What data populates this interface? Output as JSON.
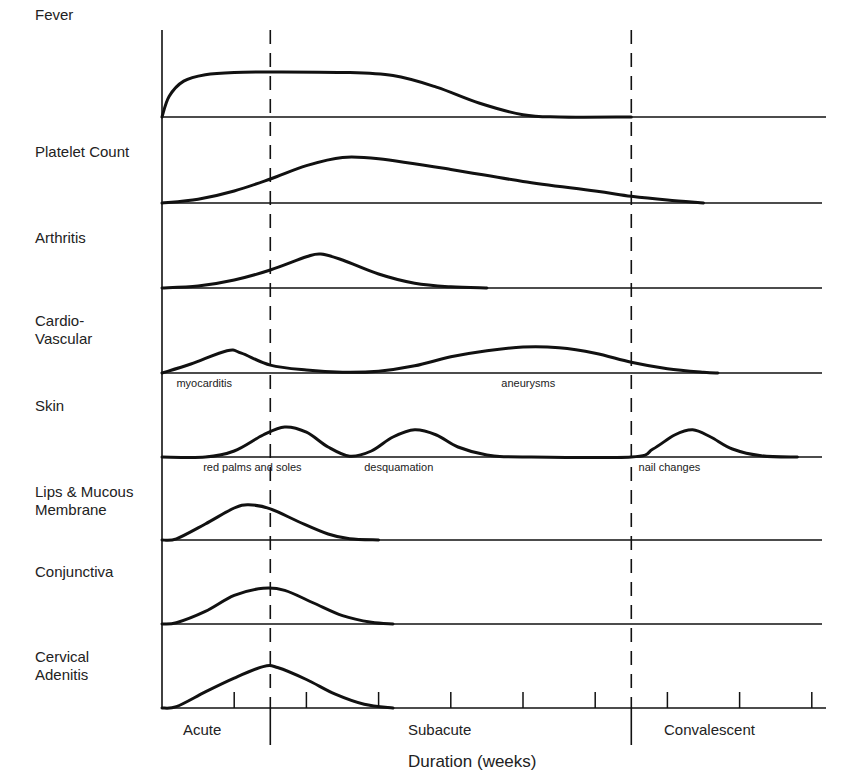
{
  "chart_data": {
    "type": "line",
    "title": "",
    "xlabel": "Duration (weeks)",
    "ylabel": "",
    "layout": "stacked small-multiples, one clinical feature per row, shared time axis",
    "x_unit": "weeks",
    "xlim": [
      0,
      9.2
    ],
    "x_ticks": [
      1,
      2,
      3,
      4,
      5,
      6,
      7,
      8,
      9
    ],
    "grid": false,
    "phases": [
      {
        "label": "Acute",
        "start": 0,
        "end": 1.5
      },
      {
        "label": "Subacute",
        "start": 1.5,
        "end": 6.5
      },
      {
        "label": "Convalescent",
        "start": 6.5,
        "end": 9.2
      }
    ],
    "phase_dividers": [
      1.5,
      6.5
    ],
    "rows": [
      {
        "label": "Fever",
        "annotations": [],
        "points": [
          [
            0,
            0
          ],
          [
            0.1,
            0.45
          ],
          [
            0.3,
            0.78
          ],
          [
            0.6,
            0.92
          ],
          [
            1,
            0.97
          ],
          [
            1.5,
            0.98
          ],
          [
            2.5,
            0.97
          ],
          [
            3.2,
            0.9
          ],
          [
            3.8,
            0.65
          ],
          [
            4.4,
            0.3
          ],
          [
            5,
            0.05
          ],
          [
            5.5,
            0
          ],
          [
            6.5,
            0
          ]
        ]
      },
      {
        "label": "Platelet Count",
        "annotations": [],
        "points": [
          [
            0,
            0
          ],
          [
            0.5,
            0.08
          ],
          [
            1,
            0.25
          ],
          [
            1.5,
            0.5
          ],
          [
            2,
            0.78
          ],
          [
            2.5,
            0.95
          ],
          [
            3,
            0.92
          ],
          [
            4,
            0.7
          ],
          [
            5,
            0.45
          ],
          [
            6,
            0.25
          ],
          [
            6.5,
            0.14
          ],
          [
            7,
            0.06
          ],
          [
            7.5,
            0
          ]
        ]
      },
      {
        "label": "Arthritis",
        "annotations": [],
        "points": [
          [
            0,
            0
          ],
          [
            0.5,
            0.05
          ],
          [
            1,
            0.2
          ],
          [
            1.5,
            0.45
          ],
          [
            2,
            0.78
          ],
          [
            2.2,
            0.85
          ],
          [
            2.5,
            0.7
          ],
          [
            3,
            0.35
          ],
          [
            3.5,
            0.12
          ],
          [
            4,
            0.03
          ],
          [
            4.5,
            0
          ]
        ]
      },
      {
        "label": "Cardio-\nVascular",
        "annotations": [
          {
            "text": "myocarditis",
            "x": 0.2
          },
          {
            "text": "aneurysms",
            "x": 4.7
          }
        ],
        "points": [
          [
            0,
            0
          ],
          [
            0.4,
            0.25
          ],
          [
            0.9,
            0.62
          ],
          [
            1.1,
            0.55
          ],
          [
            1.5,
            0.22
          ],
          [
            2,
            0.08
          ],
          [
            2.5,
            0.02
          ],
          [
            3,
            0.05
          ],
          [
            3.5,
            0.2
          ],
          [
            4,
            0.45
          ],
          [
            4.5,
            0.62
          ],
          [
            5,
            0.72
          ],
          [
            5.5,
            0.7
          ],
          [
            6,
            0.55
          ],
          [
            6.5,
            0.3
          ],
          [
            7,
            0.12
          ],
          [
            7.5,
            0.02
          ],
          [
            7.7,
            0
          ]
        ]
      },
      {
        "label": "Skin",
        "annotations": [
          {
            "text": "red palms and soles",
            "x": 0.57
          },
          {
            "text": "desquamation",
            "x": 2.8
          },
          {
            "text": "nail changes",
            "x": 6.6
          }
        ],
        "points": [
          [
            0,
            0
          ],
          [
            0.6,
            0
          ],
          [
            1,
            0.15
          ],
          [
            1.4,
            0.55
          ],
          [
            1.7,
            0.75
          ],
          [
            2,
            0.62
          ],
          [
            2.3,
            0.25
          ],
          [
            2.6,
            0.02
          ],
          [
            2.9,
            0.15
          ],
          [
            3.2,
            0.5
          ],
          [
            3.5,
            0.68
          ],
          [
            3.8,
            0.55
          ],
          [
            4.1,
            0.25
          ],
          [
            4.5,
            0.05
          ],
          [
            5,
            0
          ],
          [
            6.5,
            0
          ],
          [
            6.8,
            0.2
          ],
          [
            7.1,
            0.55
          ],
          [
            7.35,
            0.68
          ],
          [
            7.6,
            0.5
          ],
          [
            7.9,
            0.2
          ],
          [
            8.3,
            0.03
          ],
          [
            8.8,
            0
          ]
        ]
      },
      {
        "label": "Lips & Mucous\nMembrane",
        "annotations": [],
        "points": [
          [
            0,
            0
          ],
          [
            0.2,
            0.03
          ],
          [
            0.6,
            0.4
          ],
          [
            1,
            0.8
          ],
          [
            1.2,
            0.88
          ],
          [
            1.5,
            0.78
          ],
          [
            1.9,
            0.45
          ],
          [
            2.3,
            0.15
          ],
          [
            2.6,
            0.03
          ],
          [
            3,
            0
          ]
        ]
      },
      {
        "label": "Conjunctiva",
        "annotations": [],
        "points": [
          [
            0,
            0
          ],
          [
            0.2,
            0.03
          ],
          [
            0.6,
            0.3
          ],
          [
            1,
            0.68
          ],
          [
            1.4,
            0.85
          ],
          [
            1.7,
            0.8
          ],
          [
            2.1,
            0.5
          ],
          [
            2.5,
            0.2
          ],
          [
            2.9,
            0.04
          ],
          [
            3.2,
            0
          ]
        ]
      },
      {
        "label": "Cervical\nAdenitis",
        "annotations": [],
        "points": [
          [
            0,
            0
          ],
          [
            0.2,
            0.03
          ],
          [
            0.6,
            0.35
          ],
          [
            1,
            0.65
          ],
          [
            1.4,
            0.9
          ],
          [
            1.6,
            0.88
          ],
          [
            2,
            0.62
          ],
          [
            2.4,
            0.3
          ],
          [
            2.8,
            0.08
          ],
          [
            3.2,
            0
          ]
        ]
      }
    ]
  },
  "axis": {
    "xlabel": "Duration (weeks)",
    "phase_labels": [
      "Acute",
      "Subacute",
      "Convalescent"
    ]
  },
  "style": {
    "ink": "#111111",
    "background": "#ffffff"
  }
}
